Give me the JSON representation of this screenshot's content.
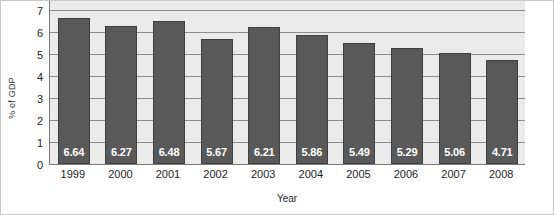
{
  "chart_data": {
    "type": "bar",
    "title": "",
    "xlabel": "Year",
    "ylabel": "% of GDP",
    "categories": [
      "1999",
      "2000",
      "2001",
      "2002",
      "2003",
      "2004",
      "2005",
      "2006",
      "2007",
      "2008"
    ],
    "values": [
      6.64,
      6.27,
      6.48,
      5.67,
      6.21,
      5.86,
      5.49,
      5.29,
      5.06,
      4.71
    ],
    "data_labels": [
      "6.64",
      "6.27",
      "6.48",
      "5.67",
      "6.21",
      "5.86",
      "5.49",
      "5.29",
      "5.06",
      "4.71"
    ],
    "ylim": [
      0,
      7
    ],
    "yticks": [
      0,
      1,
      2,
      3,
      4,
      5,
      6,
      7
    ],
    "ytick_labels": [
      "0",
      "1",
      "2",
      "3",
      "4",
      "5",
      "6",
      "7"
    ],
    "grid": true,
    "grid_axis": "y",
    "legend": false,
    "legend_position": "none",
    "colors": {
      "bar_fill": "#595959",
      "bar_border": "#3f3f3f",
      "plot_background": "#ebebeb",
      "gridline": "#8d8d8d",
      "axis_line": "#7a7a7a",
      "data_label_text": "#ffffff",
      "tick_text": "#1d1d1d",
      "figure_background": "#ffffff",
      "figure_border": "#c9c9c9"
    }
  }
}
